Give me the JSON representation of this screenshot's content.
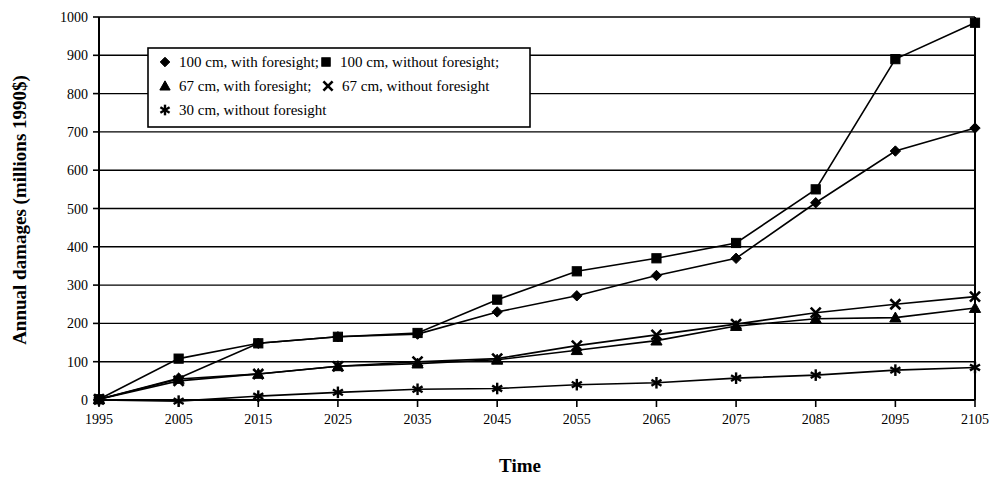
{
  "chart_data": {
    "type": "line",
    "title": "",
    "xlabel": "Time",
    "ylabel": "Annual damages (millions 1990$)",
    "categories": [
      1995,
      2005,
      2015,
      2025,
      2035,
      2045,
      2055,
      2065,
      2075,
      2085,
      2095,
      2105
    ],
    "xtick_labels": [
      "1995",
      "2005",
      "2015",
      "2025",
      "2035",
      "2045",
      "2055",
      "2065",
      "2075",
      "2085",
      "2095",
      "2105"
    ],
    "ytick_labels": [
      "0",
      "100",
      "200",
      "300",
      "400",
      "500",
      "600",
      "700",
      "800",
      "900",
      "1000"
    ],
    "ylim": [
      0,
      1000
    ],
    "ytick_step": 100,
    "grid": "horizontal",
    "legend_position": "top-left-inside",
    "series": [
      {
        "name": "100 cm, with foresight;",
        "marker": "diamond",
        "color": "#000000",
        "values": [
          2,
          57,
          148,
          165,
          172,
          230,
          272,
          325,
          370,
          515,
          650,
          710
        ]
      },
      {
        "name": "100 cm, without foresight;",
        "marker": "square",
        "color": "#000000",
        "values": [
          2,
          108,
          148,
          165,
          175,
          262,
          336,
          370,
          410,
          550,
          890,
          985
        ]
      },
      {
        "name": "67 cm, with foresight;",
        "marker": "triangle",
        "color": "#000000",
        "values": [
          2,
          55,
          68,
          88,
          95,
          105,
          130,
          155,
          193,
          212,
          215,
          240
        ]
      },
      {
        "name": "67 cm, without foresight",
        "marker": "x",
        "color": "#000000",
        "values": [
          2,
          50,
          68,
          88,
          100,
          108,
          142,
          170,
          198,
          228,
          250,
          270
        ]
      },
      {
        "name": "30 cm, without foresight",
        "marker": "star",
        "color": "#000000",
        "values": [
          0,
          -3,
          10,
          20,
          28,
          30,
          40,
          45,
          57,
          65,
          78,
          85
        ]
      }
    ]
  },
  "legend": {
    "entries": [
      {
        "marker": "diamond",
        "label": "100 cm, with foresight;"
      },
      {
        "marker": "square",
        "label": "100 cm, without foresight;"
      },
      {
        "marker": "triangle",
        "label": "67 cm, with foresight;"
      },
      {
        "marker": "x",
        "label": "67 cm, without foresight"
      },
      {
        "marker": "star",
        "label": "30 cm, without foresight"
      }
    ]
  }
}
